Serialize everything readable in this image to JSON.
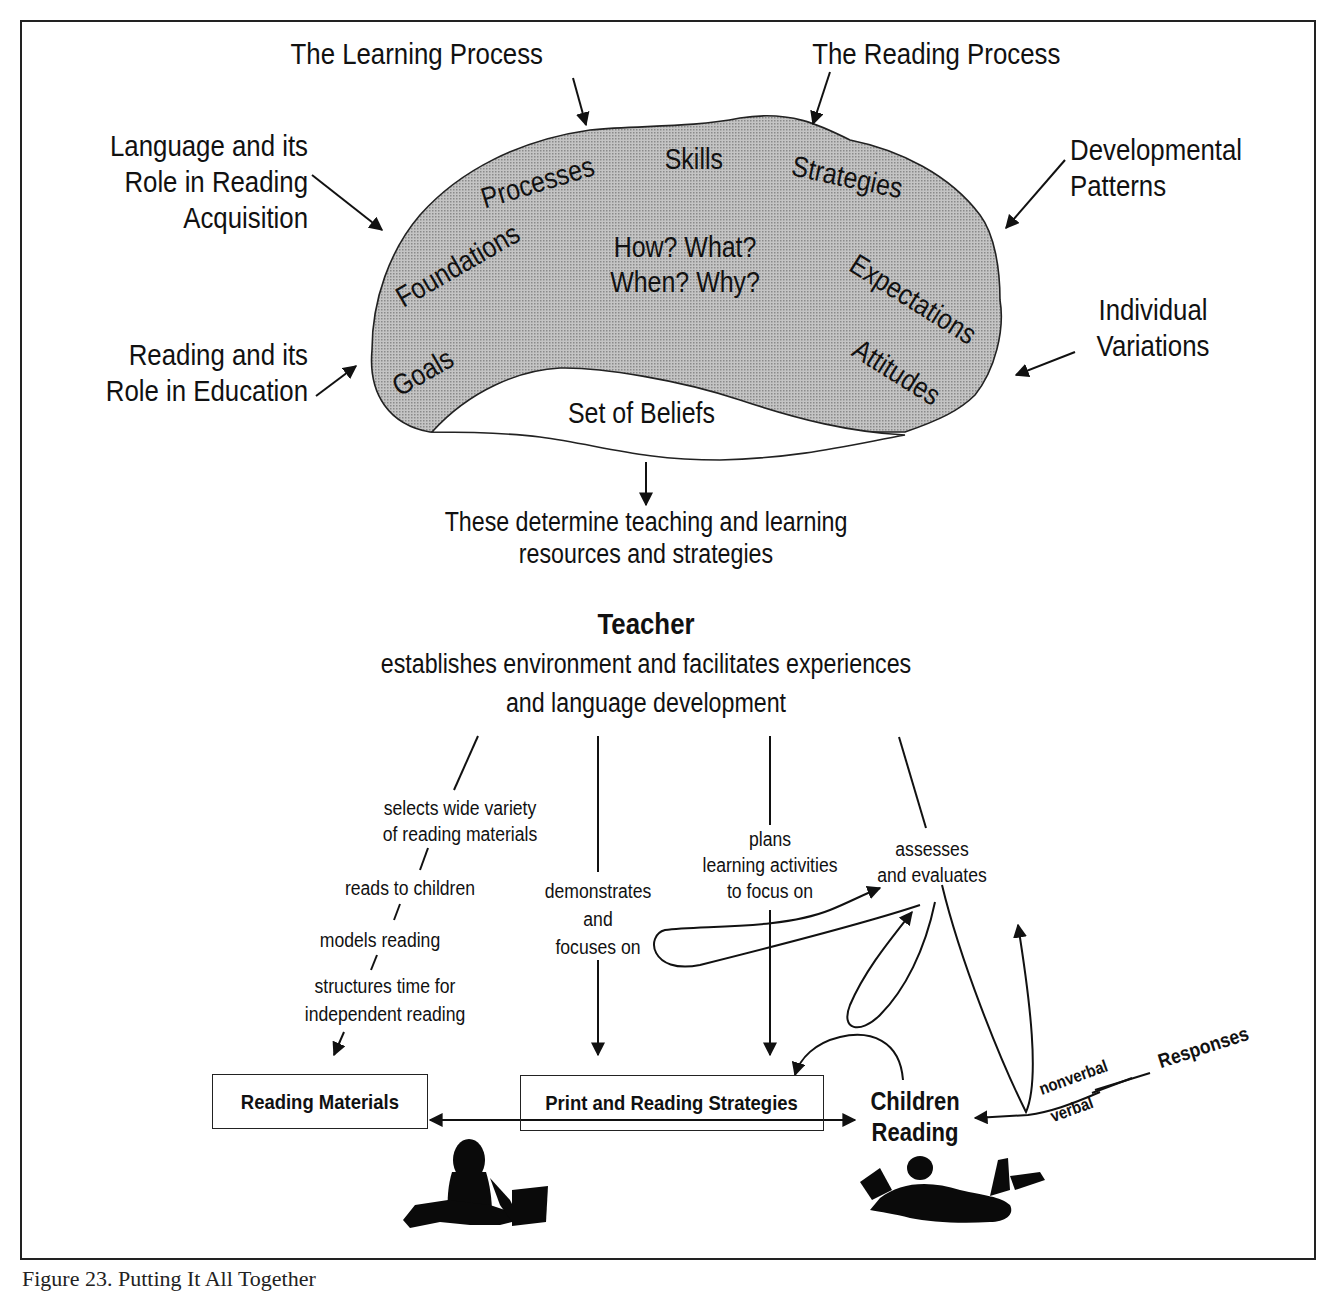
{
  "figure": {
    "caption": "Figure 23. Putting It All Together"
  },
  "outer_influences": {
    "learning_process": "The Learning Process",
    "reading_process": "The Reading Process",
    "language_role": [
      "Language and its",
      "Role in Reading",
      "Acquisition"
    ],
    "developmental_patterns": [
      "Developmental",
      "Patterns"
    ],
    "reading_role": [
      "Reading and its",
      "Role in Education"
    ],
    "individual_variations": [
      "Individual",
      "Variations"
    ]
  },
  "beliefs_cloud": {
    "words": {
      "processes": "Processes",
      "skills": "Skills",
      "strategies": "Strategies",
      "foundations": "Foundations",
      "expectations": "Expectations",
      "goals": "Goals",
      "attitudes": "Attitudes"
    },
    "questions": [
      "How? What?",
      "When? Why?"
    ],
    "label": "Set of Beliefs",
    "fill_color": "#b8b8b8"
  },
  "determines": [
    "These determine teaching and learning",
    "resources and strategies"
  ],
  "teacher": {
    "title": "Teacher",
    "description": [
      "establishes environment and facilitates experiences",
      "and language development"
    ]
  },
  "branches": {
    "materials_chain": [
      [
        "selects wide variety",
        "of reading materials"
      ],
      [
        "reads to children"
      ],
      [
        "models reading"
      ],
      [
        "structures time for",
        "independent reading"
      ]
    ],
    "demonstrates": [
      "demonstrates",
      "and",
      "focuses on"
    ],
    "plans": [
      "plans",
      "learning activities",
      "to focus on"
    ],
    "assesses": [
      "assesses",
      "and evaluates"
    ]
  },
  "boxes": {
    "reading_materials": "Reading Materials",
    "print_strategies": "Print and Reading Strategies"
  },
  "children": {
    "label": [
      "Children",
      "Reading"
    ]
  },
  "responses": {
    "label": "Responses",
    "nonverbal": "nonverbal",
    "verbal": "verbal"
  }
}
